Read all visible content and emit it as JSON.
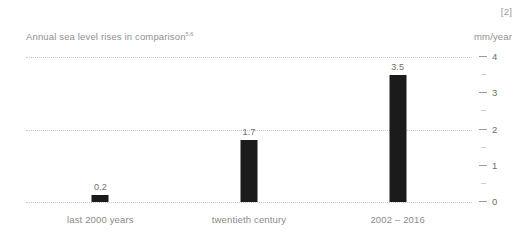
{
  "figure_reference": "[2]",
  "header": {
    "title": "Annual sea level rises in comparison",
    "title_superscript": "5,6",
    "unit_label": "mm/year"
  },
  "chart_data": {
    "type": "bar",
    "title": "Annual sea level rises in comparison",
    "xlabel": "",
    "ylabel": "mm/year",
    "ylim": [
      0,
      4
    ],
    "grid": true,
    "gridlines": [
      0,
      2,
      4
    ],
    "legend": "none",
    "bar_color": "#1b1b1b",
    "categories": [
      "last 2000 years",
      "twentieth century",
      "2002 – 2016"
    ],
    "values": [
      0.2,
      1.7,
      3.5
    ],
    "value_labels": [
      "0.2",
      "1.7",
      "3.5"
    ],
    "major_ticks": [
      0,
      1,
      2,
      3,
      4
    ],
    "major_tick_labels": [
      "0",
      "1",
      "2",
      "3",
      "4"
    ],
    "minor_ticks": [
      0.5,
      1.5,
      2.5,
      3.5
    ]
  },
  "colors": {
    "background": "#ffffff",
    "bar": "#1b1b1b",
    "grid": "#c9c9c9",
    "text": "#8a8a8a",
    "tick": "#9a9a9a"
  }
}
